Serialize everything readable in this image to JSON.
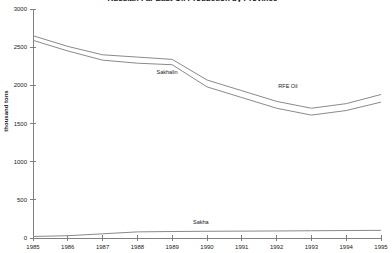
{
  "chart_data": {
    "type": "line",
    "title": "Russian Far East Oil Production by Province",
    "xlabel": "",
    "ylabel": "thousand tons",
    "x": [
      1985,
      1986,
      1987,
      1988,
      1989,
      1990,
      1991,
      1992,
      1993,
      1994,
      1995
    ],
    "xtick_labels": [
      "1985",
      "1986",
      "1987",
      "1988",
      "1989",
      "1990",
      "1991",
      "1992",
      "1993",
      "1994",
      "1995"
    ],
    "xlim": [
      1985,
      1995
    ],
    "ylim": [
      0,
      3000
    ],
    "ytick_labels": [
      "0",
      "500",
      "1000",
      "1500",
      "2000",
      "2500",
      "3000"
    ],
    "yticks": [
      0,
      500,
      1000,
      1500,
      2000,
      2500,
      3000
    ],
    "grid": false,
    "legend": "none",
    "annotations": [
      {
        "text": "Sakhalin",
        "x": 1988.55,
        "y": 2180
      },
      {
        "text": "RFE Oil",
        "x": 1992.05,
        "y": 1990
      },
      {
        "text": "Sakha",
        "x": 1989.6,
        "y": 215
      }
    ],
    "series": [
      {
        "name": "RFE Oil",
        "values": [
          2650,
          2510,
          2400,
          2370,
          2340,
          2070,
          1930,
          1790,
          1700,
          1760,
          1880
        ]
      },
      {
        "name": "Sakhalin",
        "values": [
          2590,
          2450,
          2330,
          2290,
          2270,
          1980,
          1840,
          1700,
          1610,
          1670,
          1780
        ]
      },
      {
        "name": "Sakha",
        "values": [
          20,
          30,
          55,
          80,
          85,
          88,
          90,
          92,
          95,
          98,
          100
        ]
      }
    ],
    "colors": {
      "line": "#8a8a8a",
      "axis": "#808080",
      "text": "#1a1a1a",
      "background": "#ffffff"
    }
  }
}
